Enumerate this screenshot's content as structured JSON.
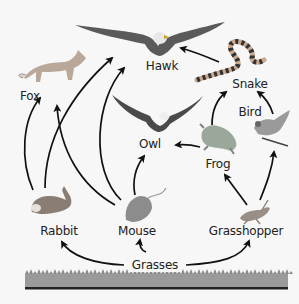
{
  "diagram": {
    "type": "food-web",
    "background": "#f7f7f7",
    "arrow_color": "#111111",
    "organisms": [
      {
        "id": "hawk",
        "label": "Hawk",
        "icon": "hawk-icon",
        "x": 162,
        "y": 66
      },
      {
        "id": "fox",
        "label": "Fox",
        "icon": "fox-icon",
        "x": 30,
        "y": 90
      },
      {
        "id": "snake",
        "label": "Snake",
        "icon": "snake-icon",
        "x": 250,
        "y": 78
      },
      {
        "id": "owl",
        "label": "Owl",
        "icon": "owl-icon",
        "x": 160,
        "y": 141
      },
      {
        "id": "bird",
        "label": "Bird",
        "icon": "bird-icon",
        "x": 260,
        "y": 109
      },
      {
        "id": "frog",
        "label": "Frog",
        "icon": "frog-icon",
        "x": 218,
        "y": 158
      },
      {
        "id": "rabbit",
        "label": "Rabbit",
        "icon": "rabbit-icon",
        "x": 62,
        "y": 224
      },
      {
        "id": "mouse",
        "label": "Mouse",
        "icon": "mouse-icon",
        "x": 138,
        "y": 224
      },
      {
        "id": "grasshopper",
        "label": "Grasshopper",
        "icon": "grasshopper-icon",
        "x": 243,
        "y": 224
      },
      {
        "id": "grasses",
        "label": "Grasses",
        "icon": "grass-icon",
        "x": 150,
        "y": 257
      }
    ],
    "edges": [
      {
        "from": "grasses",
        "to": "rabbit"
      },
      {
        "from": "grasses",
        "to": "mouse"
      },
      {
        "from": "grasses",
        "to": "grasshopper"
      },
      {
        "from": "rabbit",
        "to": "fox"
      },
      {
        "from": "rabbit",
        "to": "hawk"
      },
      {
        "from": "mouse",
        "to": "fox"
      },
      {
        "from": "mouse",
        "to": "hawk"
      },
      {
        "from": "mouse",
        "to": "owl"
      },
      {
        "from": "grasshopper",
        "to": "frog"
      },
      {
        "from": "grasshopper",
        "to": "bird"
      },
      {
        "from": "frog",
        "to": "owl"
      },
      {
        "from": "frog",
        "to": "snake"
      },
      {
        "from": "bird",
        "to": "snake"
      },
      {
        "from": "snake",
        "to": "hawk"
      }
    ]
  }
}
